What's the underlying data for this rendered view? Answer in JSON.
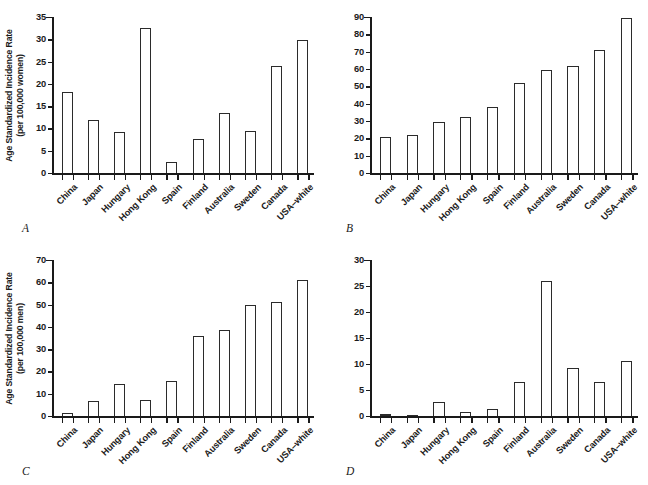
{
  "figure": {
    "background": "#ffffff",
    "ink_color": "#1a1a1a",
    "categories": [
      "China",
      "Japan",
      "Hungary",
      "Hong Kong",
      "Spain",
      "Finland",
      "Australia",
      "Sweden",
      "Canada",
      "USA–white"
    ]
  },
  "chart_data": [
    {
      "type": "bar",
      "panel": "A",
      "panel_label": "A",
      "title": "",
      "xlabel": "",
      "ylabel_line1": "Age Standardized Incidence Rate",
      "ylabel_line2": "(per 100,000 women)",
      "ylabel": "Age Standardized Incidence Rate (per 100,000 women)",
      "categories": [
        "China",
        "Japan",
        "Hungary",
        "Hong Kong",
        "Spain",
        "Finland",
        "Australia",
        "Sweden",
        "Canada",
        "USA–white"
      ],
      "values": [
        18.2,
        11.8,
        9.1,
        32.5,
        2.4,
        7.7,
        13.4,
        9.5,
        24.0,
        29.8
      ],
      "ylim": [
        0,
        35
      ],
      "yticks": [
        0,
        5,
        10,
        15,
        20,
        25,
        30,
        35
      ],
      "ytick_labels": [
        "0",
        "5",
        "10",
        "15",
        "20",
        "25",
        "30",
        "35"
      ],
      "grid": false,
      "legend": "none"
    },
    {
      "type": "bar",
      "panel": "B",
      "panel_label": "B",
      "title": "",
      "xlabel": "",
      "ylabel_line1": "",
      "ylabel_line2": "",
      "ylabel": "",
      "categories": [
        "China",
        "Japan",
        "Hungary",
        "Hong Kong",
        "Spain",
        "Finland",
        "Australia",
        "Sweden",
        "Canada",
        "USA–white"
      ],
      "values": [
        21.0,
        21.8,
        29.5,
        32.4,
        38.2,
        51.8,
        59.2,
        61.8,
        70.8,
        89.6
      ],
      "ylim": [
        0,
        90
      ],
      "yticks": [
        0,
        10,
        20,
        30,
        40,
        50,
        60,
        70,
        80,
        90
      ],
      "ytick_labels": [
        "0",
        "10",
        "20",
        "30",
        "40",
        "50",
        "60",
        "70",
        "80",
        "90"
      ],
      "grid": false,
      "legend": "none"
    },
    {
      "type": "bar",
      "panel": "C",
      "panel_label": "C",
      "title": "",
      "xlabel": "",
      "ylabel_line1": "Age Standardized Incidence Rate",
      "ylabel_line2": "(per 100,000 men)",
      "ylabel": "Age Standardized Incidence Rate (per 100,000 men)",
      "categories": [
        "China",
        "Japan",
        "Hungary",
        "Hong Kong",
        "Spain",
        "Finland",
        "Australia",
        "Sweden",
        "Canada",
        "USA–white"
      ],
      "values": [
        1.5,
        6.6,
        14.2,
        7.4,
        15.6,
        36.0,
        38.8,
        50.0,
        51.0,
        61.2
      ],
      "ylim": [
        0,
        70
      ],
      "yticks": [
        0,
        10,
        20,
        30,
        40,
        50,
        60,
        70
      ],
      "ytick_labels": [
        "0",
        "10",
        "20",
        "30",
        "40",
        "50",
        "60",
        "70"
      ],
      "grid": false,
      "legend": "none"
    },
    {
      "type": "bar",
      "panel": "D",
      "panel_label": "D",
      "title": "",
      "xlabel": "",
      "ylabel_line1": "",
      "ylabel_line2": "",
      "ylabel": "",
      "categories": [
        "China",
        "Japan",
        "Hungary",
        "Hong Kong",
        "Spain",
        "Finland",
        "Australia",
        "Sweden",
        "Canada",
        "USA–white"
      ],
      "values": [
        0.3,
        0.2,
        2.7,
        0.7,
        1.3,
        6.5,
        25.9,
        9.3,
        6.5,
        10.6
      ],
      "ylim": [
        0,
        30
      ],
      "yticks": [
        0,
        5,
        10,
        15,
        20,
        25,
        30
      ],
      "ytick_labels": [
        "0",
        "5",
        "10",
        "15",
        "20",
        "25",
        "30"
      ],
      "grid": false,
      "legend": "none"
    }
  ]
}
